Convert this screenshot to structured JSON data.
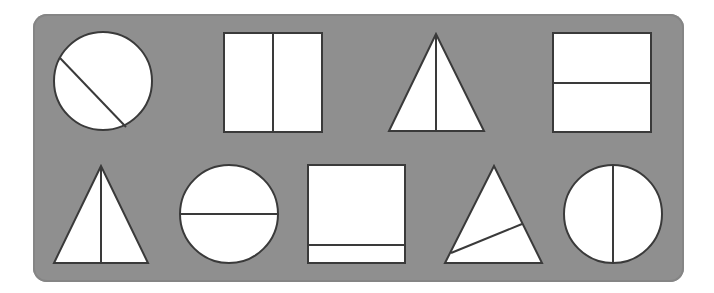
{
  "panel": {
    "background": "#8f8f8f",
    "stroke": "#3a3a3a",
    "fill": "#ffffff"
  },
  "rows": [
    {
      "shapes": [
        {
          "type": "circle",
          "division": "diagonal",
          "equal_parts": true
        },
        {
          "type": "square",
          "division": "vertical",
          "equal_parts": true
        },
        {
          "type": "triangle",
          "division": "vertical-median",
          "equal_parts": true
        },
        {
          "type": "square",
          "division": "horizontal",
          "equal_parts": true
        }
      ]
    },
    {
      "shapes": [
        {
          "type": "triangle",
          "division": "vertical-median",
          "equal_parts": true
        },
        {
          "type": "circle",
          "division": "horizontal",
          "equal_parts": true
        },
        {
          "type": "square",
          "division": "horizontal-near-bottom",
          "equal_parts": false
        },
        {
          "type": "triangle",
          "division": "slanted",
          "equal_parts": false
        },
        {
          "type": "circle",
          "division": "vertical",
          "equal_parts": true
        }
      ]
    }
  ]
}
